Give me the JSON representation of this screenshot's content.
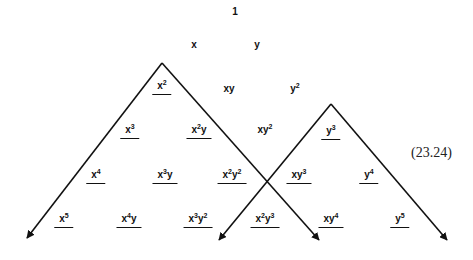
{
  "equation_number": "(23.24)",
  "terms": [
    {
      "id": "t1",
      "base": "1",
      "sup": "",
      "base2": "",
      "sup2": "",
      "x": 235,
      "y": 12,
      "underlined": false
    },
    {
      "id": "tx",
      "base": "x",
      "sup": "",
      "base2": "",
      "sup2": "",
      "x": 194,
      "y": 45,
      "underlined": false
    },
    {
      "id": "ty",
      "base": "y",
      "sup": "",
      "base2": "",
      "sup2": "",
      "x": 257,
      "y": 45,
      "underlined": false
    },
    {
      "id": "tx2",
      "base": "x",
      "sup": "2",
      "base2": "",
      "sup2": "",
      "x": 162,
      "y": 86,
      "underlined": true
    },
    {
      "id": "txy",
      "base": "xy",
      "sup": "",
      "base2": "",
      "sup2": "",
      "x": 229,
      "y": 89,
      "underlined": false
    },
    {
      "id": "ty2",
      "base": "y",
      "sup": "2",
      "base2": "",
      "sup2": "",
      "x": 295,
      "y": 89,
      "underlined": false
    },
    {
      "id": "tx3",
      "base": "x",
      "sup": "3",
      "base2": "",
      "sup2": "",
      "x": 130,
      "y": 130,
      "underlined": true
    },
    {
      "id": "tx2y",
      "base": "x",
      "sup": "2",
      "base2": "y",
      "sup2": "",
      "x": 199,
      "y": 130,
      "underlined": true
    },
    {
      "id": "txy2",
      "base": "xy",
      "sup": "2",
      "base2": "",
      "sup2": "",
      "x": 265,
      "y": 130,
      "underlined": false
    },
    {
      "id": "ty3",
      "base": "y",
      "sup": "3",
      "base2": "",
      "sup2": "",
      "x": 331,
      "y": 131,
      "underlined": true
    },
    {
      "id": "tx4",
      "base": "x",
      "sup": "4",
      "base2": "",
      "sup2": "",
      "x": 96,
      "y": 175,
      "underlined": true
    },
    {
      "id": "tx3y",
      "base": "x",
      "sup": "3",
      "base2": "y",
      "sup2": "",
      "x": 165,
      "y": 175,
      "underlined": true
    },
    {
      "id": "tx2y2",
      "base": "x",
      "sup": "2",
      "base2": "y",
      "sup2": "2",
      "x": 232,
      "y": 175,
      "underlined": true
    },
    {
      "id": "txy3",
      "base": "xy",
      "sup": "3",
      "base2": "",
      "sup2": "",
      "x": 299,
      "y": 175,
      "underlined": true
    },
    {
      "id": "ty4",
      "base": "y",
      "sup": "4",
      "base2": "",
      "sup2": "",
      "x": 369,
      "y": 175,
      "underlined": true
    },
    {
      "id": "tx5",
      "base": "x",
      "sup": "5",
      "base2": "",
      "sup2": "",
      "x": 64,
      "y": 219,
      "underlined": true
    },
    {
      "id": "tx4y",
      "base": "x",
      "sup": "4",
      "base2": "y",
      "sup2": "",
      "x": 129,
      "y": 219,
      "underlined": true
    },
    {
      "id": "tx3y2",
      "base": "x",
      "sup": "3",
      "base2": "y",
      "sup2": "2",
      "x": 198,
      "y": 219,
      "underlined": true
    },
    {
      "id": "tx2y3",
      "base": "x",
      "sup": "2",
      "base2": "y",
      "sup2": "3",
      "x": 265,
      "y": 219,
      "underlined": true
    },
    {
      "id": "txy4",
      "base": "xy",
      "sup": "4",
      "base2": "",
      "sup2": "",
      "x": 331,
      "y": 219,
      "underlined": true
    },
    {
      "id": "ty5",
      "base": "y",
      "sup": "5",
      "base2": "",
      "sup2": "",
      "x": 400,
      "y": 219,
      "underlined": true
    }
  ],
  "arrows": {
    "left_triangle": {
      "apex": [
        162,
        63
      ],
      "left_tip": [
        27,
        238
      ],
      "right_tip": [
        319,
        240
      ]
    },
    "right_triangle": {
      "apex": [
        331,
        104
      ],
      "left_tip": [
        219,
        240
      ],
      "right_tip": [
        447,
        240
      ]
    }
  }
}
